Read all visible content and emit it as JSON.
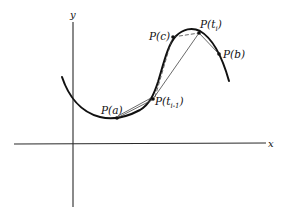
{
  "diagram": {
    "title": "",
    "axes": {
      "x_label": "x",
      "y_label": "y"
    },
    "points": [
      {
        "id": "a",
        "label": "P(a)"
      },
      {
        "id": "ti_minus_1",
        "label_main": "P(t",
        "label_sub": "i-1",
        "label_close": ")"
      },
      {
        "id": "c",
        "label": "P(c)"
      },
      {
        "id": "ti",
        "label_main": "P(t",
        "label_sub": "i",
        "label_close": ")"
      },
      {
        "id": "b",
        "label": "P(b)"
      }
    ],
    "elements": {
      "curve": "smooth curve from lower-left arc rising to a peak then falling right",
      "chords": [
        "P(t_{i-1}) to P(t_i) solid secant",
        "P(c) to P(t_i) dashed",
        "P(a) to P(t_{i-1}) thin secant"
      ],
      "colors": {
        "stroke": "#111111",
        "background": "#ffffff"
      }
    }
  }
}
